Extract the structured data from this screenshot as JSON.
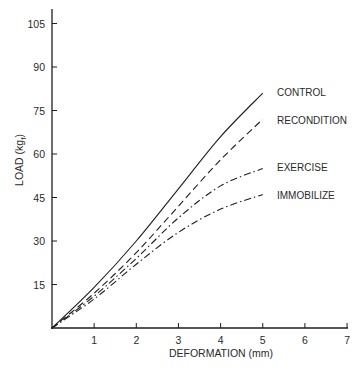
{
  "chart_data": {
    "type": "line",
    "title": "",
    "xlabel": "DEFORMATION (mm)",
    "ylabel": "LOAD (kg",
    "ylabel_subscript": "f",
    "ylabel_close": ")",
    "xlim": [
      0,
      7
    ],
    "ylim": [
      0,
      110
    ],
    "xticks": [
      1,
      2,
      3,
      4,
      5,
      6,
      7
    ],
    "yticks": [
      15,
      30,
      45,
      60,
      75,
      90,
      105
    ],
    "grid": false,
    "legend_position": "inline-right-of-curve-ends",
    "x": [
      0,
      1,
      2,
      3,
      4,
      5
    ],
    "series": [
      {
        "name": "CONTROL",
        "style": "solid",
        "values": [
          0,
          14,
          30,
          48,
          66,
          81
        ]
      },
      {
        "name": "RECONDITION",
        "style": "dashed",
        "values": [
          0,
          12,
          26,
          42,
          58,
          72
        ]
      },
      {
        "name": "EXERCISE",
        "style": "dash-dot",
        "values": [
          0,
          11,
          24,
          38,
          49,
          55
        ]
      },
      {
        "name": "IMMOBILIZE",
        "style": "dash-dot",
        "values": [
          0,
          10,
          22,
          33,
          41,
          46
        ]
      }
    ]
  },
  "colors": {
    "line": "#1e1e1e",
    "text": "#2a2a2a",
    "background": "#ffffff"
  }
}
